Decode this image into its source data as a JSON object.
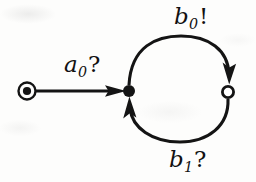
{
  "diagram": {
    "type": "state-transition-diagram",
    "stroke_color": "#141414",
    "background_color": "#fdfdfc",
    "nodes": [
      {
        "id": "initial-marker",
        "kind": "bullseye",
        "label": "",
        "cx": 27,
        "cy": 91,
        "outer_r": 9,
        "inner_r": 4
      },
      {
        "id": "state-filled",
        "kind": "filled-circle",
        "label": "",
        "cx": 129,
        "cy": 91,
        "r": 6
      },
      {
        "id": "state-hollow",
        "kind": "hollow-circle",
        "label": "",
        "cx": 228,
        "cy": 92,
        "r": 6
      }
    ],
    "edges": [
      {
        "id": "edge-a0",
        "from": "initial-marker",
        "to": "state-filled",
        "shape": "straight",
        "label": "a0?",
        "label_base": "a",
        "label_sub": "0",
        "label_mark": "?"
      },
      {
        "id": "edge-b0",
        "from": "state-filled",
        "to": "state-hollow",
        "shape": "arc-top",
        "label": "b0!",
        "label_base": "b",
        "label_sub": "0",
        "label_mark": "!"
      },
      {
        "id": "edge-b1",
        "from": "state-hollow",
        "to": "state-filled",
        "shape": "arc-bottom",
        "label": "b1?",
        "label_base": "b",
        "label_sub": "1",
        "label_mark": "?"
      }
    ]
  }
}
